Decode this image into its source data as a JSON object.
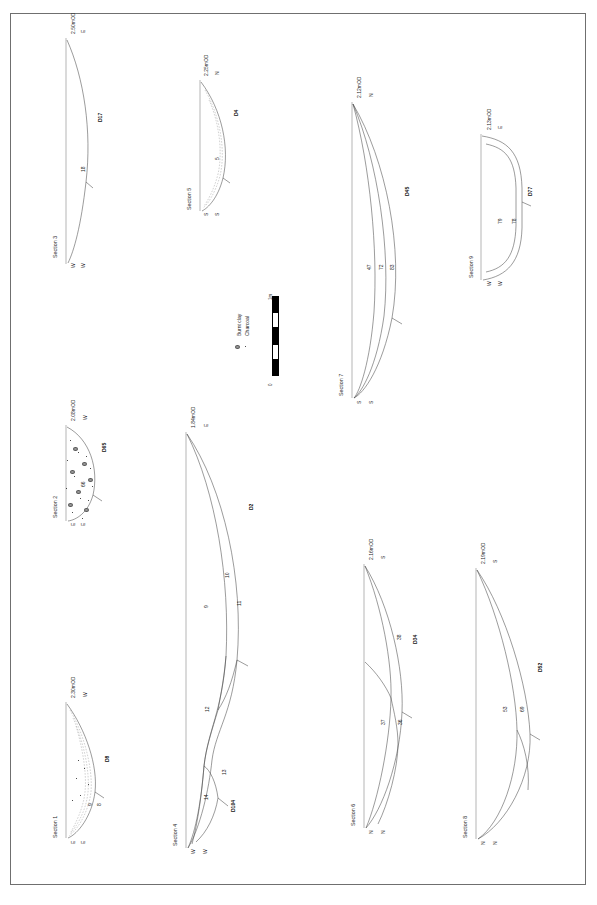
{
  "figure": {
    "orientation": "landscape-content-on-portrait-sheet",
    "border_color": "#6f6f6f",
    "background": "#ffffff",
    "line_color": "#4a4a4a"
  },
  "legend": {
    "items": [
      {
        "symbol": "burnt-clay-blob",
        "label": "Burnt clay"
      },
      {
        "symbol": "charcoal-dot",
        "label": "Charcoal"
      }
    ],
    "scale": {
      "min_label": "0",
      "max_label": "1m",
      "segments": [
        "dark",
        "light",
        "dark",
        "light",
        "dark"
      ]
    }
  },
  "sections": [
    {
      "id": "section-1",
      "title": "Section 1",
      "od_level": "2.30mOD",
      "compass_left": "E",
      "compass_right": "W",
      "contexts": [
        "9",
        "8"
      ],
      "feature": "D8",
      "fill": "charcoal-flecks"
    },
    {
      "id": "section-2",
      "title": "Section 2",
      "od_level": "2.08mOD",
      "compass_left": "E",
      "compass_right": "W",
      "contexts": [
        "66"
      ],
      "feature": "D65",
      "fill": "burnt-clay-and-charcoal"
    },
    {
      "id": "section-3",
      "title": "Section 3",
      "od_level": "2.50mOD",
      "compass_left": "W",
      "compass_right": "E",
      "contexts": [
        "18"
      ],
      "feature": "D17",
      "fill": "plain"
    },
    {
      "id": "section-4",
      "title": "Section 4",
      "od_level": "1.84mOD",
      "compass_left": "W",
      "compass_right": "E",
      "contexts": [
        "9",
        "10",
        "11",
        "12",
        "13",
        "14"
      ],
      "feature": "D2",
      "feature_2": "D104",
      "fill": "plain"
    },
    {
      "id": "section-5",
      "title": "Section 5",
      "od_level": "2.25mOD",
      "compass_left": "S",
      "compass_right": "N",
      "contexts": [
        "5"
      ],
      "feature": "D4",
      "fill": "plain"
    },
    {
      "id": "section-6",
      "title": "Section 6",
      "od_level": "2.16mOD",
      "compass_left": "N",
      "compass_right": "S",
      "contexts": [
        "38",
        "37",
        "36"
      ],
      "feature": "D34",
      "fill": "plain"
    },
    {
      "id": "section-7",
      "title": "Section 7",
      "od_level": "2.12mOD",
      "compass_left": "S",
      "compass_right": "N",
      "contexts": [
        "47",
        "72",
        "83"
      ],
      "feature": "D45",
      "fill": "plain"
    },
    {
      "id": "section-8",
      "title": "Section 8",
      "od_level": "2.19mOD",
      "compass_left": "N",
      "compass_right": "S",
      "contexts": [
        "53",
        "69"
      ],
      "feature": "D52",
      "fill": "plain"
    },
    {
      "id": "section-9",
      "title": "Section 9",
      "od_level": "2.13mOD",
      "compass_left": "W",
      "compass_right": "E",
      "contexts": [
        "79",
        "78"
      ],
      "feature": "D77",
      "fill": "plain"
    }
  ]
}
